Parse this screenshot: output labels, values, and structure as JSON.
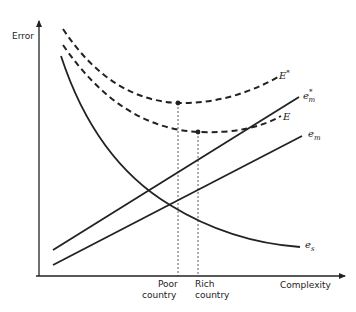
{
  "diagram": {
    "y_axis_label": "Error",
    "x_axis_label": "Complexity",
    "markers": [
      {
        "line1": "Poor",
        "line2": "country"
      },
      {
        "line1": "Rich",
        "line2": "country"
      }
    ],
    "curves": {
      "E_star": {
        "base": "E",
        "sup": "*",
        "style": "dashed"
      },
      "E": {
        "base": "E",
        "style": "dashed"
      },
      "e_m_star": {
        "base": "e",
        "sub": "m",
        "sup": "*",
        "style": "solid"
      },
      "e_m": {
        "base": "e",
        "sub": "m",
        "style": "solid"
      },
      "e_s": {
        "base": "e",
        "sub": "s",
        "style": "solid"
      }
    }
  }
}
